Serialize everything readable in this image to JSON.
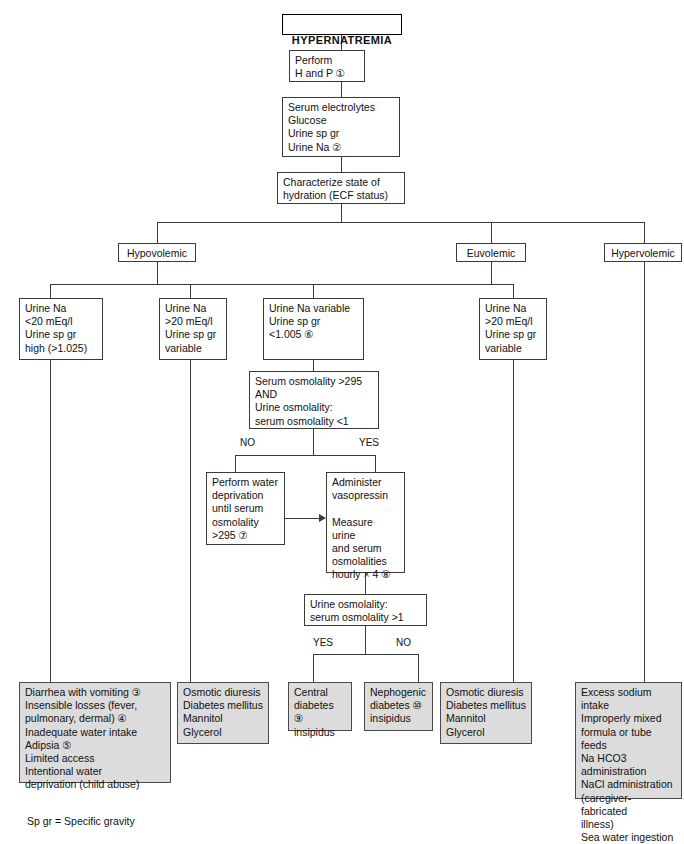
{
  "diagram": {
    "title": "HYPERNATREMIA",
    "footnote": "Sp gr = Specific gravity",
    "nodes": {
      "title": "HYPERNATREMIA",
      "history_physical": "Perform\nH and P  ①",
      "labs": "Serum electrolytes\nGlucose\nUrine sp gr\nUrine Na  ②",
      "characterize": "Characterize state of\nhydration (ECF status)",
      "hypovolemic": "Hypovolemic",
      "euvolemic": "Euvolemic",
      "hypervolemic": "Hypervolemic",
      "urine_na_low": "Urine Na\n  <20 mEq/l\nUrine sp gr\n  high (>1.025)",
      "urine_na_high_hypo": "Urine Na\n  >20 mEq/l\nUrine sp gr\n  variable",
      "urine_na_variable": "Urine Na variable\nUrine sp gr\n   <1.005  ⑥",
      "urine_na_high_eu": "Urine Na\n  >20 mEq/l\nUrine sp gr\n  variable",
      "osm_check": "Serum osmolality >295\nAND\nUrine osmolality:\nserum osmolality <1",
      "water_deprivation": "Perform water\ndeprivation\nuntil serum\nosmolality\n>295  ⑦",
      "vasopressin": "Administer\nvasopressin\n\nMeasure urine\nand serum\nosmolalities\nhourly × 4  ⑧",
      "urine_serum_ratio": "Urine osmolality:\nserum osmolality >1",
      "hypovolemic_causes": "Diarrhea with vomiting  ③\nInsensible losses (fever,\n   pulmonary, dermal)  ④\nInadequate water intake\n   Adipsia ⑤\n   Limited access\n   Intentional water\n      deprivation (child abuse)",
      "osmotic_diuresis_left": "Osmotic diuresis\n   Diabetes mellitus\n   Mannitol\n   Glycerol",
      "central_di": "Central\ndiabetes  ⑨\ninsipidus",
      "nephrogenic_di": "Nephogenic\ndiabetes  ⑩\ninsipidus",
      "osmotic_diuresis_right": "Osmotic diuresis\n   Diabetes mellitus\n   Mannitol\n   Glycerol",
      "excess_sodium": "Excess sodium intake\n   Improperly mixed\n      formula or tube feeds\nNa HCO3 administration\nNaCl administration\n   (caregiver-fabricated\n      illness)\nSea water ingestion\nHypernatremic enemas\nIntravenous hypertonic\n   saline"
    },
    "branch_labels": {
      "osm_no": "NO",
      "osm_yes": "YES",
      "ratio_yes": "YES",
      "ratio_no": "NO"
    }
  }
}
